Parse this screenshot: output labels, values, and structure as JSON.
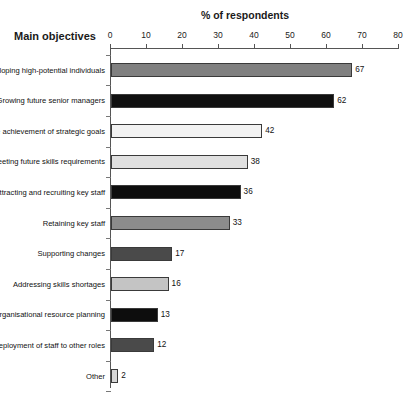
{
  "chart_data": {
    "type": "bar",
    "orientation": "horizontal",
    "title": "",
    "xlabel": "% of respondents",
    "ylabel": "Main objectives",
    "xlim": [
      0,
      80
    ],
    "xticks": [
      0,
      10,
      20,
      30,
      40,
      50,
      60,
      70,
      80
    ],
    "grid": false,
    "legend": "none",
    "categories": [
      "Developing high-potential individuals",
      "Growing future senior managers",
      "Enabling the achievement of strategic goals",
      "Meeting future skills requirements",
      "Attracting and recruiting key staff",
      "Retaining key staff",
      "Supporting changes",
      "Addressing skills shortages",
      "Assisting organisational resource planning",
      "Redeployment of staff to other roles",
      "Other"
    ],
    "values": [
      67,
      62,
      42,
      38,
      36,
      33,
      17,
      16,
      13,
      12,
      2
    ],
    "value_labels": [
      "67",
      "62",
      "42",
      "38",
      "36",
      "33",
      "17",
      "16",
      "13",
      "12",
      "2"
    ],
    "bar_colors": [
      "#808080",
      "#101010",
      "#f2f2f2",
      "#e0e0e0",
      "#0d0d0d",
      "#8c8c8c",
      "#4a4a4a",
      "#c4c4c4",
      "#0d0d0d",
      "#4a4a4a",
      "#d6d6d6"
    ],
    "bar_border_color": "#3a3a3a"
  },
  "axis": {
    "x_title": "% of respondents",
    "y_title": "Main objectives",
    "tick_labels": [
      "0",
      "10",
      "20",
      "30",
      "40",
      "50",
      "60",
      "70",
      "80"
    ]
  }
}
